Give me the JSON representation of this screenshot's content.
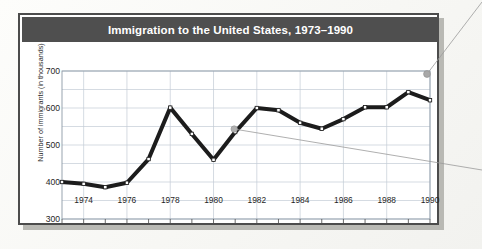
{
  "figure": {
    "title": "Immigration to the United States, 1973–1990",
    "title_bar_color": "#4f4f4f",
    "title_text_color": "#ffffff",
    "frame_color": "#4c4c4c",
    "background": "#ffffff"
  },
  "chart_data": {
    "type": "line",
    "title": "Immigration to the United States, 1973–1990",
    "xlabel": "",
    "ylabel": "Number of immigrants (in thousands)",
    "x": [
      1973,
      1974,
      1975,
      1976,
      1977,
      1978,
      1979,
      1980,
      1981,
      1982,
      1983,
      1984,
      1985,
      1986,
      1987,
      1988,
      1989,
      1990
    ],
    "values": [
      400,
      395,
      386,
      398,
      462,
      601,
      530,
      460,
      535,
      600,
      594,
      560,
      544,
      570,
      602,
      602,
      643,
      621
    ],
    "series": [
      {
        "name": "Number of immigrants (in thousands)",
        "values": [
          400,
          395,
          386,
          398,
          462,
          601,
          530,
          460,
          535,
          600,
          594,
          560,
          544,
          570,
          602,
          602,
          643,
          621
        ]
      }
    ],
    "xlim": [
      1973,
      1990
    ],
    "ylim": [
      300,
      700
    ],
    "ytick_labels": [
      "300",
      "400",
      "500",
      "600",
      "700"
    ],
    "ytick_values": [
      300,
      400,
      500,
      600,
      700
    ],
    "xtick_labels": [
      "1974",
      "1976",
      "1978",
      "1980",
      "1982",
      "1984",
      "1986",
      "1988",
      "1990"
    ],
    "xtick_values": [
      1974,
      1976,
      1978,
      1980,
      1982,
      1984,
      1986,
      1988,
      1990
    ],
    "grid": true,
    "grid_minor_y_step": 50,
    "grid_x_step": 2,
    "legend": "none",
    "line_color": "#1c1c1c",
    "line_width": 4,
    "marker": "square",
    "marker_face_color": "#ffffff",
    "grid_color": "#c3ccd6"
  },
  "annotations": {
    "color": "#9a9a9a",
    "leaders": [
      {
        "name": "callout-leader-1981",
        "anchor_year": 1981,
        "anchor_value": 535
      },
      {
        "name": "callout-leader-1990",
        "anchor_year": 1990,
        "anchor_value": 700
      }
    ]
  }
}
